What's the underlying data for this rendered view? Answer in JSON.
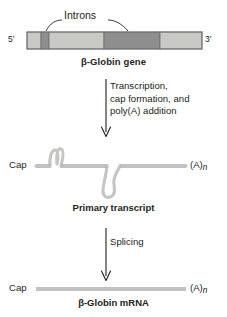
{
  "figure": {
    "colors": {
      "exon": "#c9cac5",
      "intron": "#8e8e8e",
      "outline": "#6d6e71",
      "rna_line": "#c4c6c3",
      "rna_line_edge": "#8d8f8c",
      "text": "#231f20",
      "arrow": "#231f20",
      "background": "#ffffff"
    }
  },
  "gene_panel": {
    "introns_label": "Introns",
    "five_prime_label": "5′",
    "three_prime_label": "3′",
    "gene_label": "β-Globin gene",
    "segments": [
      {
        "name": "exon-1",
        "type": "exon",
        "x": 27,
        "width": 14
      },
      {
        "name": "intron-1",
        "type": "intron",
        "x": 41,
        "width": 8
      },
      {
        "name": "exon-2",
        "type": "exon",
        "x": 49,
        "width": 55
      },
      {
        "name": "intron-2",
        "type": "intron",
        "x": 104,
        "width": 56
      },
      {
        "name": "exon-3",
        "type": "exon",
        "x": 160,
        "width": 42
      }
    ],
    "bar_y": 32,
    "bar_height": 17
  },
  "step_one": {
    "label": "Transcription, cap formation, and poly(A) addition",
    "lines": [
      "Transcription,",
      "cap formation, and",
      "poly(A) addition"
    ]
  },
  "transcript_panel": {
    "cap_label": "Cap",
    "polya_label": "(A)",
    "polya_subscript": "n",
    "caption": "Primary transcript"
  },
  "step_two": {
    "label": "Splicing"
  },
  "mrna_panel": {
    "cap_label": "Cap",
    "polya_label": "(A)",
    "polya_subscript": "n",
    "caption": "β-Globin mRNA"
  }
}
